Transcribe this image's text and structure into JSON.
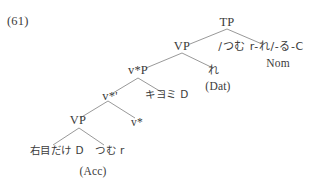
{
  "figure": {
    "example_number": "(61)",
    "type": "syntactic-tree",
    "language": "Japanese",
    "line_color": "#8d8d8d",
    "text_color": "#3b3b3b",
    "background_color": "#ffffff"
  },
  "tree": {
    "nodes": {
      "tp": "TP",
      "vp_upper": "VP",
      "vstar_p": "v*P",
      "vstar_bar": "v*'",
      "vp_lower": "VP",
      "vstar": "v*"
    },
    "terminals": {
      "phonological_form": "/つむ r-れ/-る-C",
      "nominative_gloss": "Nom",
      "dative_pronoun": "れ",
      "dative_case": "(Dat)",
      "kiyomi_d": "キヨミ D",
      "migime_dake_d": "右目だけ D",
      "accusative_case": "(Acc)",
      "tsumu_r": "つむ r"
    }
  }
}
